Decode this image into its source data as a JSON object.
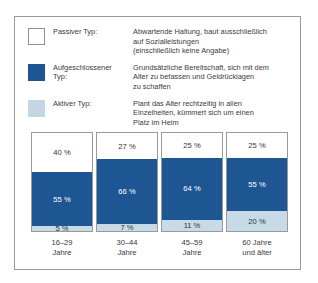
{
  "legend": {
    "items": [
      {
        "swatch": "white",
        "term_lines": [
          "Passiver Typ:"
        ],
        "desc_lines": [
          "Abwartende Haltung, baut ausschließlich",
          "auf Sozialleistungen",
          "(einschließlich keine Angabe)"
        ]
      },
      {
        "swatch": "dark-blue",
        "term_lines": [
          "Aufgeschlossener",
          "Typ:"
        ],
        "desc_lines": [
          "Grundsätzliche Bereitschaft, sich mit dem",
          "Alter zu befassen und Geldrücklagen",
          "zu schaffen"
        ]
      },
      {
        "swatch": "light-blue",
        "term_lines": [
          "Aktiver Typ:"
        ],
        "desc_lines": [
          "Plant das Alter rechtzeitig in allen",
          "Einzelheiten, kümmert sich um einen",
          "Platz im Heim"
        ]
      }
    ]
  },
  "colors": {
    "dark_blue": "#1e5693",
    "light_blue": "#c7dae7",
    "white": "#ffffff",
    "border": "#9a9a9a",
    "text": "#3a3a3a"
  },
  "chart_data": {
    "type": "bar",
    "stacked": true,
    "title": "",
    "xlabel": "",
    "ylabel": "",
    "ylim": [
      0,
      100
    ],
    "grid": false,
    "legend_position": "top",
    "categories": [
      "16–29 Jahre",
      "30–44 Jahre",
      "45–59 Jahre",
      "60 Jahre und älter"
    ],
    "category_lines": [
      [
        "16–29",
        "Jahre"
      ],
      [
        "30–44",
        "Jahre"
      ],
      [
        "45–59",
        "Jahre"
      ],
      [
        "60 Jahre",
        "und älter"
      ]
    ],
    "series": [
      {
        "name": "Passiver Typ",
        "color": "#ffffff",
        "values": [
          40,
          27,
          25,
          25
        ],
        "labels": [
          "40 %",
          "27 %",
          "25 %",
          "25 %"
        ]
      },
      {
        "name": "Aufgeschlossener Typ",
        "color": "#1e5693",
        "values": [
          55,
          66,
          64,
          55
        ],
        "labels": [
          "55 %",
          "66 %",
          "64 %",
          "55 %"
        ]
      },
      {
        "name": "Aktiver Typ",
        "color": "#c7dae7",
        "values": [
          5,
          7,
          11,
          20
        ],
        "labels": [
          "5 %",
          "7 %",
          "11 %",
          "20 %"
        ]
      }
    ]
  }
}
